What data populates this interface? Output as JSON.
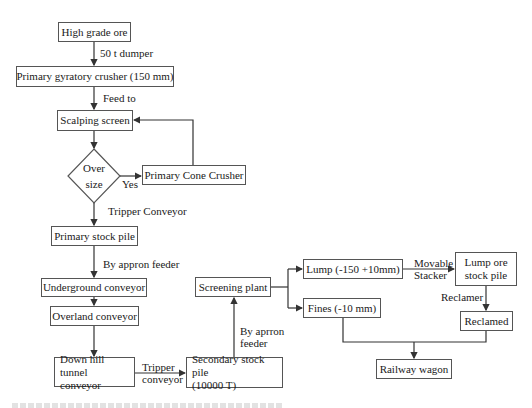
{
  "diagram": {
    "type": "flowchart",
    "nodes": {
      "high_grade_ore": "High grade ore",
      "primary_crusher": "Primary gyratory crusher (150 mm)",
      "scalping_screen": "Scalping screen",
      "oversize_decision": {
        "line1": "Over",
        "line2": "size"
      },
      "primary_cone_crusher": "Primary Cone Crusher",
      "primary_stock_pile": "Primary stock pile",
      "underground_conveyor": "Underground conveyor",
      "overland_conveyor": "Overland conveyor",
      "downhill_tunnel_conveyor": {
        "line1": "Down hill tunnel",
        "line2": "conveyor"
      },
      "secondary_stock_pile": {
        "line1": "Secondary stock pile",
        "line2": "(10000 T)"
      },
      "screening_plant": "Screening plant",
      "lump": "Lump (-150 +10mm)",
      "fines": "Fines (-10 mm)",
      "lump_ore_stock_pile": {
        "line1": "Lump ore",
        "line2": "stock pile"
      },
      "reclamed": "Reclamed",
      "railway_wagon": "Railway wagon"
    },
    "edge_labels": {
      "dumper": "50 t dumper",
      "feed_to": "Feed to",
      "yes": "Yes",
      "tripper_conveyor_1": "Tripper Conveyor",
      "apron_feeder_1": "By appron feeder",
      "tripper_conveyor_2": {
        "line1": "Tripper",
        "line2": "conveyor"
      },
      "apron_feeder_2": {
        "line1": "By aprron",
        "line2": "feeder"
      },
      "movable_stacker": {
        "line1": "Movable",
        "line2": "Stacker"
      },
      "reclamer": "Reclamer"
    },
    "edges": [
      [
        "High grade ore",
        "Primary gyratory crusher (150 mm)",
        "50 t dumper"
      ],
      [
        "Primary gyratory crusher (150 mm)",
        "Scalping screen",
        "Feed to"
      ],
      [
        "Scalping screen",
        "Over size",
        ""
      ],
      [
        "Over size",
        "Primary Cone Crusher",
        "Yes"
      ],
      [
        "Primary Cone Crusher",
        "Scalping screen",
        ""
      ],
      [
        "Over size",
        "Primary stock pile",
        "Tripper Conveyor"
      ],
      [
        "Primary stock pile",
        "Underground conveyor",
        "By appron feeder"
      ],
      [
        "Underground conveyor",
        "Overland conveyor",
        ""
      ],
      [
        "Overland conveyor",
        "Down hill tunnel conveyor",
        ""
      ],
      [
        "Down hill tunnel conveyor",
        "Secondary stock pile (10000 T)",
        "Tripper conveyor"
      ],
      [
        "Secondary stock pile (10000 T)",
        "Screening plant",
        "By aprron feeder"
      ],
      [
        "Screening plant",
        "Lump (-150 +10mm)",
        ""
      ],
      [
        "Screening plant",
        "Fines (-10 mm)",
        ""
      ],
      [
        "Lump (-150 +10mm)",
        "Lump ore stock pile",
        "Movable Stacker"
      ],
      [
        "Lump ore stock pile",
        "Reclamed",
        "Reclamer"
      ],
      [
        "Fines (-10 mm)",
        "Railway wagon",
        ""
      ],
      [
        "Reclamed",
        "Railway wagon",
        ""
      ]
    ],
    "colors": {
      "line": "#333333",
      "border": "#555555",
      "text": "#1a1a1a",
      "background": "#ffffff"
    }
  }
}
